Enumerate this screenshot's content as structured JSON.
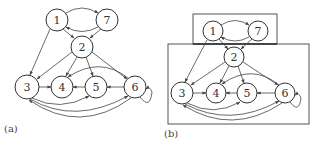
{
  "figure": {
    "panels": [
      {
        "label": "(a)",
        "nodes": [
          {
            "id": "1",
            "label": "1",
            "x": 57,
            "y": 20
          },
          {
            "id": "7",
            "label": "7",
            "x": 107,
            "y": 20
          },
          {
            "id": "2",
            "label": "2",
            "x": 82,
            "y": 47
          },
          {
            "id": "3",
            "label": "3",
            "x": 27,
            "y": 87
          },
          {
            "id": "4",
            "label": "4",
            "x": 62,
            "y": 87
          },
          {
            "id": "5",
            "label": "5",
            "x": 96,
            "y": 87
          },
          {
            "id": "6",
            "label": "6",
            "x": 135,
            "y": 87
          }
        ]
      },
      {
        "label": "(b)",
        "nodes": [
          {
            "id": "1",
            "label": "1",
            "x": 213,
            "y": 31
          },
          {
            "id": "7",
            "label": "7",
            "x": 258,
            "y": 31
          },
          {
            "id": "2",
            "label": "2",
            "x": 234,
            "y": 57
          },
          {
            "id": "3",
            "label": "3",
            "x": 182,
            "y": 93
          },
          {
            "id": "4",
            "label": "4",
            "x": 216,
            "y": 93
          },
          {
            "id": "5",
            "label": "5",
            "x": 247,
            "y": 93
          },
          {
            "id": "6",
            "label": "6",
            "x": 285,
            "y": 93
          }
        ],
        "groups": [
          {
            "name": "upper-group",
            "members": [
              "1",
              "7"
            ]
          },
          {
            "name": "lower-group",
            "members": [
              "2",
              "3",
              "4",
              "5",
              "6"
            ]
          }
        ]
      }
    ],
    "edges": [
      [
        "1",
        "7"
      ],
      [
        "7",
        "1"
      ],
      [
        "1",
        "2"
      ],
      [
        "7",
        "2"
      ],
      [
        "1",
        "3"
      ],
      [
        "2",
        "3"
      ],
      [
        "2",
        "4"
      ],
      [
        "2",
        "5"
      ],
      [
        "2",
        "6"
      ],
      [
        "3",
        "4"
      ],
      [
        "5",
        "4"
      ],
      [
        "6",
        "5"
      ],
      [
        "6",
        "4"
      ],
      [
        "3",
        "5"
      ],
      [
        "3",
        "6"
      ],
      [
        "6",
        "3"
      ],
      [
        "6",
        "6"
      ]
    ]
  }
}
